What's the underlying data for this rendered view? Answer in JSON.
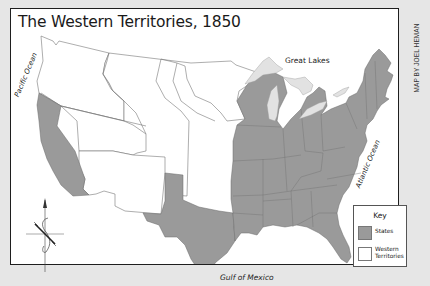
{
  "map": {
    "title": "The Western Territories, 1850",
    "credit": "MAP BY JOEL HEMAN",
    "colors": {
      "background": "#e6e6e6",
      "map_paper": "#ffffff",
      "states": "#9a9a9a",
      "lakes": "#e0e0e0",
      "borders": "#555555",
      "frame": "#1e1e1e"
    },
    "labels": {
      "pacific": "Pacific Ocean",
      "atlantic": "Atlantic Ocean",
      "great_lakes": "Great Lakes",
      "gulf": "Gulf of Mexico"
    },
    "key": {
      "title": "Key",
      "items": [
        {
          "label": "States",
          "color": "#9a9a9a"
        },
        {
          "label": "Western Territories",
          "color": "#ffffff"
        }
      ]
    },
    "compass": {
      "icon": "compass-rose-icon",
      "direction": "N"
    }
  }
}
